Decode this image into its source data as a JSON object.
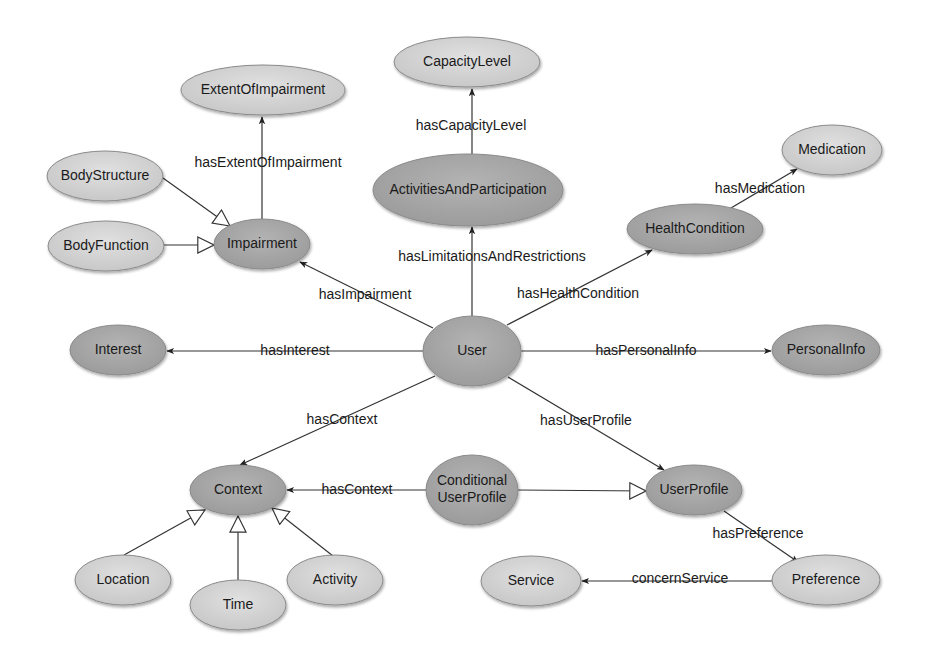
{
  "diagram": {
    "type": "ontology-graph",
    "colors": {
      "background": "#ffffff",
      "dark_node_fill": "#a6a6a6",
      "light_node_fill": "#d4d4d4",
      "node_stroke": "#8a8a8a",
      "edge": "#333333",
      "text": "#1a1a1a"
    },
    "nodes": [
      {
        "id": "ExtentOfImpairment",
        "label": "ExtentOfImpairment",
        "lines": [
          "ExtentOfImpairment"
        ],
        "cx": 263,
        "cy": 90,
        "rx": 82,
        "ry": 25,
        "shade": "light"
      },
      {
        "id": "CapacityLevel",
        "label": "CapacityLevel",
        "lines": [
          "CapacityLevel"
        ],
        "cx": 467,
        "cy": 62,
        "rx": 73,
        "ry": 25,
        "shade": "light"
      },
      {
        "id": "BodyStructure",
        "label": "BodyStructure",
        "lines": [
          "BodyStructure"
        ],
        "cx": 105,
        "cy": 176,
        "rx": 58,
        "ry": 25,
        "shade": "light"
      },
      {
        "id": "BodyFunction",
        "label": "BodyFunction",
        "lines": [
          "BodyFunction"
        ],
        "cx": 106,
        "cy": 246,
        "rx": 58,
        "ry": 25,
        "shade": "light"
      },
      {
        "id": "Impairment",
        "label": "Impairment",
        "lines": [
          "Impairment"
        ],
        "cx": 262,
        "cy": 244,
        "rx": 48,
        "ry": 25,
        "shade": "dark"
      },
      {
        "id": "ActivitiesAndParticipation",
        "label": "ActivitiesAndParticipation",
        "lines": [
          "ActivitiesAndParticipation"
        ],
        "cx": 468,
        "cy": 190,
        "rx": 95,
        "ry": 36,
        "shade": "dark"
      },
      {
        "id": "Medication",
        "label": "Medication",
        "lines": [
          "Medication"
        ],
        "cx": 832,
        "cy": 150,
        "rx": 50,
        "ry": 25,
        "shade": "light"
      },
      {
        "id": "HealthCondition",
        "label": "HealthCondition",
        "lines": [
          "HealthCondition"
        ],
        "cx": 695,
        "cy": 229,
        "rx": 68,
        "ry": 25,
        "shade": "dark"
      },
      {
        "id": "Interest",
        "label": "Interest",
        "lines": [
          "Interest"
        ],
        "cx": 118,
        "cy": 350,
        "rx": 48,
        "ry": 25,
        "shade": "dark"
      },
      {
        "id": "User",
        "label": "User",
        "lines": [
          "User"
        ],
        "cx": 472,
        "cy": 351,
        "rx": 49,
        "ry": 35,
        "shade": "dark"
      },
      {
        "id": "PersonalInfo",
        "label": "PersonalInfo",
        "lines": [
          "PersonalInfo"
        ],
        "cx": 826,
        "cy": 350,
        "rx": 54,
        "ry": 25,
        "shade": "dark"
      },
      {
        "id": "Context",
        "label": "Context",
        "lines": [
          "Context"
        ],
        "cx": 238,
        "cy": 490,
        "rx": 48,
        "ry": 25,
        "shade": "dark"
      },
      {
        "id": "ConditionalUserProfile",
        "label": "Conditional UserProfile",
        "lines": [
          "Conditional",
          "UserProfile"
        ],
        "cx": 472,
        "cy": 490,
        "rx": 46,
        "ry": 35,
        "shade": "dark"
      },
      {
        "id": "UserProfile",
        "label": "UserProfile",
        "lines": [
          "UserProfile"
        ],
        "cx": 694,
        "cy": 490,
        "rx": 48,
        "ry": 25,
        "shade": "dark"
      },
      {
        "id": "Location",
        "label": "Location",
        "lines": [
          "Location"
        ],
        "cx": 123,
        "cy": 580,
        "rx": 48,
        "ry": 25,
        "shade": "light"
      },
      {
        "id": "Time",
        "label": "Time",
        "lines": [
          "Time"
        ],
        "cx": 238,
        "cy": 605,
        "rx": 48,
        "ry": 25,
        "shade": "light"
      },
      {
        "id": "Activity",
        "label": "Activity",
        "lines": [
          "Activity"
        ],
        "cx": 335,
        "cy": 580,
        "rx": 48,
        "ry": 25,
        "shade": "light"
      },
      {
        "id": "Service",
        "label": "Service",
        "lines": [
          "Service"
        ],
        "cx": 531,
        "cy": 581,
        "rx": 50,
        "ry": 25,
        "shade": "light"
      },
      {
        "id": "Preference",
        "label": "Preference",
        "lines": [
          "Preference"
        ],
        "cx": 826,
        "cy": 580,
        "rx": 54,
        "ry": 25,
        "shade": "light"
      }
    ],
    "edges": [
      {
        "from": "Impairment",
        "to": "ExtentOfImpairment",
        "label": "hasExtentOfImpairment",
        "kind": "property",
        "x1": 262,
        "y1": 219,
        "x2": 262,
        "y2": 117,
        "lx": 268,
        "ly": 163
      },
      {
        "from": "ActivitiesAndParticipation",
        "to": "CapacityLevel",
        "label": "hasCapacityLevel",
        "kind": "property",
        "x1": 472,
        "y1": 154,
        "x2": 472,
        "y2": 89,
        "lx": 471,
        "ly": 126
      },
      {
        "from": "BodyStructure",
        "to": "Impairment",
        "label": "",
        "kind": "subclass",
        "x1": 163,
        "y1": 178,
        "x2": 230,
        "y2": 226,
        "lx": 0,
        "ly": 0
      },
      {
        "from": "BodyFunction",
        "to": "Impairment",
        "label": "",
        "kind": "subclass",
        "x1": 164,
        "y1": 245,
        "x2": 214,
        "y2": 245,
        "lx": 0,
        "ly": 0
      },
      {
        "from": "User",
        "to": "Impairment",
        "label": "hasImpairment",
        "kind": "property",
        "x1": 433,
        "y1": 328,
        "x2": 300,
        "y2": 262,
        "lx": 365,
        "ly": 295
      },
      {
        "from": "User",
        "to": "ActivitiesAndParticipation",
        "label": "hasLimitationsAndRestrictions",
        "kind": "property",
        "x1": 472,
        "y1": 316,
        "x2": 472,
        "y2": 227,
        "lx": 492,
        "ly": 257
      },
      {
        "from": "User",
        "to": "HealthCondition",
        "label": "hasHealthCondition",
        "kind": "property",
        "x1": 507,
        "y1": 325,
        "x2": 652,
        "y2": 250,
        "lx": 578,
        "ly": 294
      },
      {
        "from": "HealthCondition",
        "to": "Medication",
        "label": "hasMedication",
        "kind": "property",
        "x1": 731,
        "y1": 208,
        "x2": 797,
        "y2": 169,
        "lx": 760,
        "ly": 189
      },
      {
        "from": "User",
        "to": "Interest",
        "label": "hasInterest",
        "kind": "property",
        "x1": 423,
        "y1": 351,
        "x2": 167,
        "y2": 351,
        "lx": 295,
        "ly": 351
      },
      {
        "from": "User",
        "to": "PersonalInfo",
        "label": "hasPersonalInfo",
        "kind": "property",
        "x1": 521,
        "y1": 351,
        "x2": 771,
        "y2": 351,
        "lx": 646,
        "ly": 351
      },
      {
        "from": "User",
        "to": "Context",
        "label": "hasContext",
        "kind": "property",
        "x1": 435,
        "y1": 376,
        "x2": 240,
        "y2": 465,
        "lx": 342,
        "ly": 420
      },
      {
        "from": "User",
        "to": "UserProfile",
        "label": "hasUserProfile",
        "kind": "property",
        "x1": 508,
        "y1": 377,
        "x2": 664,
        "y2": 470,
        "lx": 586,
        "ly": 421
      },
      {
        "from": "ConditionalUserProfile",
        "to": "Context",
        "label": "hasContext",
        "kind": "property",
        "x1": 426,
        "y1": 490,
        "x2": 287,
        "y2": 490,
        "lx": 357,
        "ly": 490
      },
      {
        "from": "ConditionalUserProfile",
        "to": "UserProfile",
        "label": "",
        "kind": "subclass",
        "x1": 518,
        "y1": 490,
        "x2": 646,
        "y2": 491,
        "lx": 0,
        "ly": 0
      },
      {
        "from": "UserProfile",
        "to": "Preference",
        "label": "hasPreference",
        "kind": "property",
        "x1": 724,
        "y1": 511,
        "x2": 798,
        "y2": 562,
        "lx": 758,
        "ly": 534
      },
      {
        "from": "Preference",
        "to": "Service",
        "label": "concernService",
        "kind": "property",
        "x1": 772,
        "y1": 581,
        "x2": 582,
        "y2": 581,
        "lx": 680,
        "ly": 579
      },
      {
        "from": "Location",
        "to": "Context",
        "label": "",
        "kind": "subclass",
        "x1": 124,
        "y1": 555,
        "x2": 205,
        "y2": 510,
        "lx": 0,
        "ly": 0
      },
      {
        "from": "Time",
        "to": "Context",
        "label": "",
        "kind": "subclass",
        "x1": 238,
        "y1": 580,
        "x2": 238,
        "y2": 516,
        "lx": 0,
        "ly": 0
      },
      {
        "from": "Activity",
        "to": "Context",
        "label": "",
        "kind": "subclass",
        "x1": 333,
        "y1": 556,
        "x2": 272,
        "y2": 508,
        "lx": 0,
        "ly": 0
      }
    ]
  }
}
